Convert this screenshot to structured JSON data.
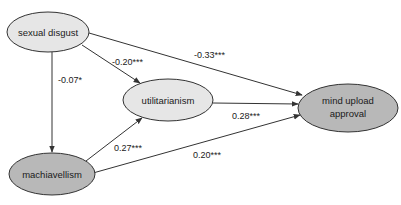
{
  "diagram": {
    "type": "path-model",
    "nodes": [
      {
        "id": "sexual_disgust",
        "label": "sexual disgust",
        "fill": "#e6e6e6",
        "cx": 48,
        "cy": 32,
        "rx": 41,
        "ry": 20
      },
      {
        "id": "utilitarianism",
        "label": "utilitarianism",
        "fill": "#e6e6e6",
        "cx": 168,
        "cy": 100,
        "rx": 45,
        "ry": 21
      },
      {
        "id": "machiavellism",
        "label": "machiavellism",
        "fill": "#b8b8b8",
        "cx": 52,
        "cy": 174,
        "rx": 43,
        "ry": 21
      },
      {
        "id": "mind_upload_approval",
        "label_line1": "mind upload",
        "label_line2": "approval",
        "fill": "#b8b8b8",
        "cx": 348,
        "cy": 108,
        "rx": 50,
        "ry": 24
      }
    ],
    "edges": [
      {
        "from": "sexual_disgust",
        "to": "utilitarianism",
        "label": "-0.20***"
      },
      {
        "from": "sexual_disgust",
        "to": "mind_upload_approval",
        "label": "-0.33***"
      },
      {
        "from": "sexual_disgust",
        "to": "machiavellism",
        "label": "-0.07*"
      },
      {
        "from": "machiavellism",
        "to": "utilitarianism",
        "label": "0.27***"
      },
      {
        "from": "utilitarianism",
        "to": "mind_upload_approval",
        "label": "0.28***"
      },
      {
        "from": "machiavellism",
        "to": "mind_upload_approval",
        "label": "0.20***"
      }
    ]
  },
  "labels": {
    "sexual_disgust": "sexual disgust",
    "utilitarianism": "utilitarianism",
    "machiavellism": "machiavellism",
    "mind_upload_line1": "mind upload",
    "mind_upload_line2": "approval",
    "edge_sd_util": "-0.20***",
    "edge_sd_mua": "-0.33***",
    "edge_sd_mach": "-0.07*",
    "edge_mach_util": "0.27***",
    "edge_util_mua": "0.28***",
    "edge_mach_mua": "0.20***"
  },
  "colors": {
    "light_node": "#e6e6e6",
    "dark_node": "#b8b8b8",
    "stroke": "#333333"
  }
}
